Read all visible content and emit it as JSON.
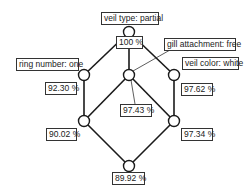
{
  "diagram": {
    "type": "concept-lattice",
    "attribute_labels": {
      "top": "veil type: partial",
      "left": "ring number: one",
      "middle": "gill attachment: free",
      "right": "veil color: white"
    },
    "support_labels": {
      "top": "100 %",
      "left": "92.30 %",
      "middle": "97.43 %",
      "right": "97.62 %",
      "lower_left": "90.02 %",
      "lower_right": "97.34 %",
      "bottom": "89.92 %"
    },
    "nodes": [
      {
        "id": "top",
        "x": 129,
        "y": 32
      },
      {
        "id": "left",
        "x": 84,
        "y": 75
      },
      {
        "id": "middle",
        "x": 129,
        "y": 75
      },
      {
        "id": "right",
        "x": 174,
        "y": 75
      },
      {
        "id": "lower_left",
        "x": 84,
        "y": 121
      },
      {
        "id": "lower_right",
        "x": 174,
        "y": 121
      },
      {
        "id": "bottom",
        "x": 129,
        "y": 166
      }
    ],
    "edges": [
      [
        "top",
        "left"
      ],
      [
        "top",
        "middle"
      ],
      [
        "top",
        "right"
      ],
      [
        "left",
        "lower_left"
      ],
      [
        "middle",
        "lower_left"
      ],
      [
        "middle",
        "lower_right"
      ],
      [
        "right",
        "lower_right"
      ],
      [
        "lower_left",
        "bottom"
      ],
      [
        "lower_right",
        "bottom"
      ]
    ]
  }
}
